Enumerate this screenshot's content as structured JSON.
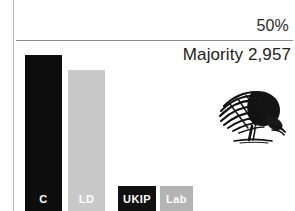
{
  "chart_data": {
    "type": "bar",
    "title": "",
    "subtitle": "",
    "xlabel": "",
    "ylabel": "",
    "ylim": [
      0,
      50
    ],
    "grid": false,
    "legend": "none",
    "threshold": {
      "label": "50%",
      "value": 50
    },
    "annotation": {
      "majority_label": "Majority 2,957"
    },
    "categories": [
      "C",
      "LD",
      "UKIP",
      "Lab"
    ],
    "values": [
      46.5,
      41.5,
      0,
      0
    ],
    "series": [
      {
        "name": "Vote share",
        "values": [
          46.5,
          41.5,
          0,
          0
        ]
      }
    ],
    "bars": [
      {
        "label": "C",
        "value": 46.5,
        "color": "#0d0d0d",
        "label_color": "#ffffff",
        "x": 25,
        "width": 37,
        "top": 55
      },
      {
        "label": "LD",
        "value": 41.5,
        "color": "#c8c8c8",
        "label_color": "#ffffff",
        "x": 68,
        "width": 37,
        "top": 70
      },
      {
        "label": "UKIP",
        "value": 0,
        "color": "#111111",
        "label_color": "#ffffff",
        "x": 118,
        "width": 38,
        "top": 186
      },
      {
        "label": "Lab",
        "value": 0,
        "color": "#b4b4b4",
        "label_color": "#ffffff",
        "x": 160,
        "width": 33,
        "top": 186
      }
    ]
  },
  "colors": {
    "conservative": "#0d0d0d",
    "libdem": "#c8c8c8",
    "ukip": "#111111",
    "labour": "#b4b4b4",
    "rule": "#8d8d8d",
    "gutter": "#b9b9b9",
    "text": "#222222"
  },
  "logo": {
    "name": "oak-tree-logo",
    "description": "Conservative oak tree sketch"
  }
}
